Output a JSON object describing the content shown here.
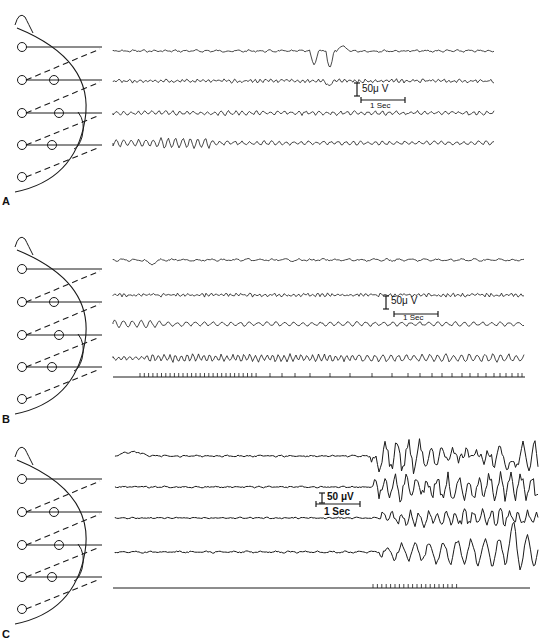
{
  "figure": {
    "panels": [
      {
        "label": "A",
        "calibration": {
          "voltage": "50μ V",
          "time": "1 Sec"
        },
        "channels": 4,
        "stimulus_marker": false
      },
      {
        "label": "B",
        "calibration": {
          "voltage": "50μ V",
          "time": "1 Sec"
        },
        "channels": 4,
        "stimulus_marker": true
      },
      {
        "label": "C",
        "calibration": {
          "voltage": "50 μV",
          "time": "1 Sec"
        },
        "channels": 4,
        "stimulus_marker": true
      }
    ],
    "montage_icon": "head-montage-diagram",
    "colors": {
      "ink": "#1a1a1a",
      "background": "#ffffff"
    }
  }
}
